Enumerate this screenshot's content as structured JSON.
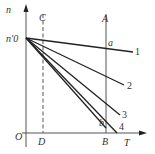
{
  "diagram": {
    "axes": {
      "y_label": "n",
      "x_label": "T",
      "origin_label": "O",
      "y_intercept_label": "n'0"
    },
    "vertical_lines": [
      {
        "top_label": "C",
        "bottom_label": "D",
        "style": "dashed"
      },
      {
        "top_label": "A",
        "bottom_label": "B",
        "style": "solid"
      }
    ],
    "lines": [
      {
        "label": "1"
      },
      {
        "label": "2"
      },
      {
        "label": "3"
      },
      {
        "label": "4"
      }
    ],
    "points": [
      {
        "label": "a"
      },
      {
        "label": "b"
      }
    ],
    "colors": {
      "stroke": "#222222",
      "axis": "#555555",
      "text": "#333333"
    }
  }
}
